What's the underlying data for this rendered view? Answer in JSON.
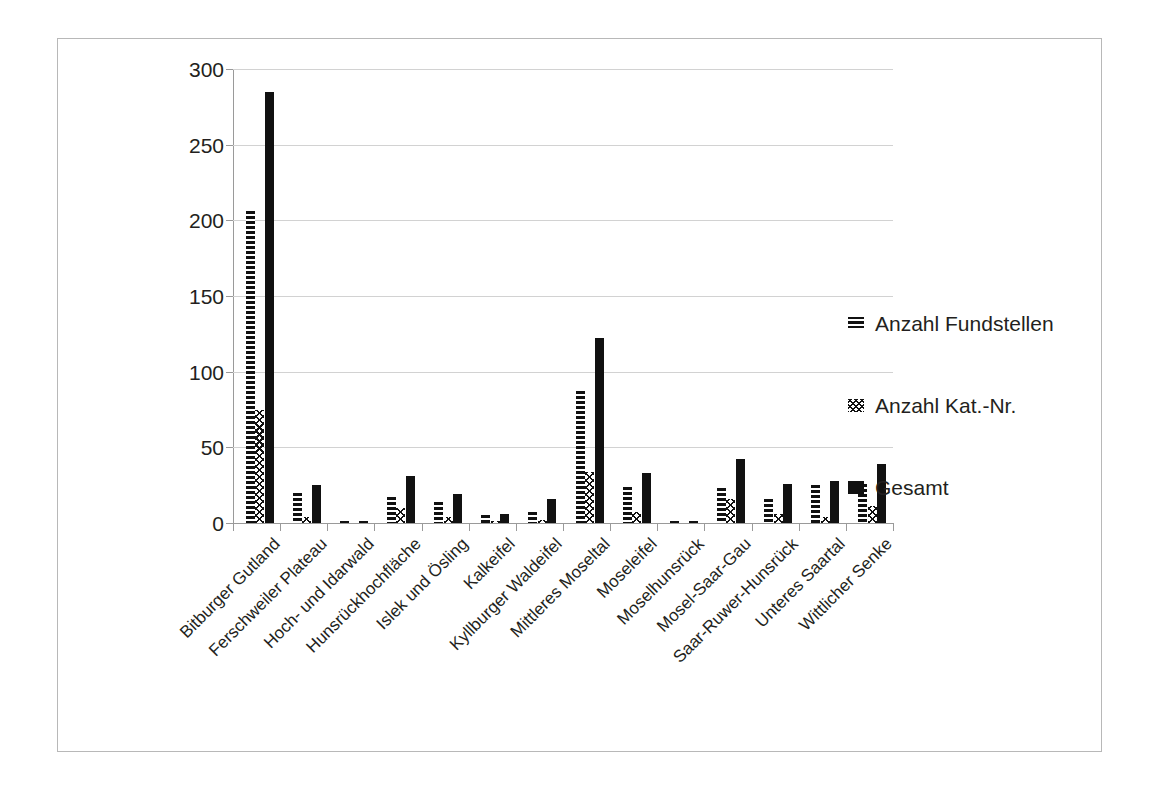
{
  "chart_data": {
    "type": "bar",
    "title": "",
    "xlabel": "",
    "ylabel": "",
    "ylim": [
      0,
      300
    ],
    "yticks": [
      0,
      50,
      100,
      150,
      200,
      250,
      300
    ],
    "grid": true,
    "legend_position": "right",
    "categories": [
      "Bitburger Gutland",
      "Ferschweiler Plateau",
      "Hoch- und Idarwald",
      "Hunsrückhochfläche",
      "Islek und Ösling",
      "Kalkeifel",
      "Kyllburger Waldeifel",
      "Mittleres Moseltal",
      "Moseleifel",
      "Moselhunsrück",
      "Mosel-Saar-Gau",
      "Saar-Ruwer-Hunsrück",
      "Unteres Saartal",
      "Wittlicher Senke"
    ],
    "series": [
      {
        "name": "Anzahl Fundstellen",
        "pattern": "horizontal-dashes",
        "color": "#111111",
        "values": [
          206,
          20,
          1,
          17,
          14,
          5,
          7,
          87,
          24,
          1,
          23,
          16,
          25,
          26
        ]
      },
      {
        "name": "Anzahl Kat.-Nr.",
        "pattern": "checkered-diamond",
        "color": "#111111",
        "values": [
          75,
          4,
          0,
          10,
          4,
          1,
          2,
          34,
          7,
          0,
          16,
          6,
          4,
          11
        ]
      },
      {
        "name": "Gesamt",
        "pattern": "solid",
        "color": "#111111",
        "values": [
          285,
          25,
          1,
          31,
          19,
          6,
          16,
          122,
          33,
          1,
          42,
          26,
          28,
          39
        ]
      }
    ]
  },
  "legend": {
    "items": [
      {
        "label": "Anzahl Fundstellen"
      },
      {
        "label": "Anzahl Kat.-Nr."
      },
      {
        "label": "Gesamt"
      }
    ]
  }
}
